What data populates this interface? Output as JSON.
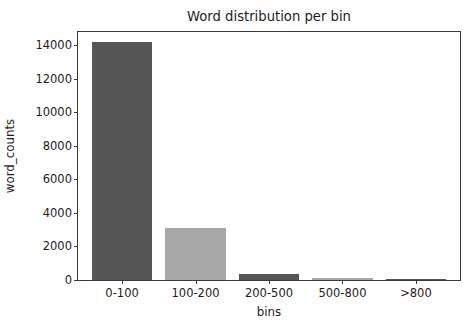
{
  "chart_data": {
    "type": "bar",
    "title": "Word distribution per bin",
    "xlabel": "bins",
    "ylabel": "word_counts",
    "categories": [
      "0-100",
      "100-200",
      "200-500",
      "500-800",
      ">800"
    ],
    "values": [
      14200,
      3100,
      350,
      100,
      15
    ],
    "bar_colors": [
      "#555555",
      "#a8a8a8",
      "#555555",
      "#a8a8a8",
      "#555555"
    ],
    "ylim": [
      0,
      14800
    ],
    "xlim": [
      -0.6,
      4.6
    ],
    "yticks": [
      0,
      2000,
      4000,
      6000,
      8000,
      10000,
      12000,
      14000
    ],
    "ytick_labels": [
      "0",
      "2000",
      "4000",
      "6000",
      "8000",
      "10000",
      "12000",
      "14000"
    ],
    "grid": false,
    "legend": null,
    "legend_position": "none",
    "background_color": "#ffffff",
    "axes_edge_color": "#3a3a3a",
    "bar_width_fraction": 0.82
  },
  "figure": {
    "background": "#ffffff"
  }
}
